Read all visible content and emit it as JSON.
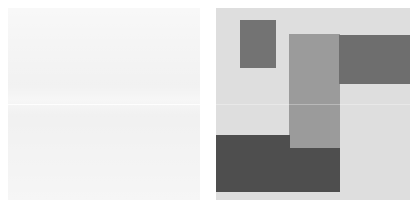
{
  "canvas": {
    "width": 417,
    "height": 216,
    "background": "#ffffff",
    "layout": "two-panel-side-by-side"
  },
  "panels": [
    {
      "id": "left-panel",
      "role": "source-image-panel",
      "label": "",
      "x": 8,
      "y": 8,
      "width": 192,
      "height": 192,
      "background": "#f0f0f0",
      "content_description": "near-blank light surface with faint horizontal banding",
      "seam_y": 96,
      "blocks": []
    },
    {
      "id": "right-panel",
      "role": "segmentation-mask-panel",
      "label": "",
      "x": 216,
      "y": 8,
      "width": 194,
      "height": 192,
      "background": "#dedede",
      "content_description": "abstract arrangement of flat gray rectangles",
      "seam_y": 96,
      "blocks": [
        {
          "id": "block-top-left-small",
          "name": "small-upper-left-rect",
          "x": 24,
          "y": 12,
          "width": 36,
          "height": 48,
          "color": "#737373",
          "tone": "mid-dark"
        },
        {
          "id": "block-center-column",
          "name": "center-vertical-rect",
          "x": 73,
          "y": 26,
          "width": 51,
          "height": 115,
          "color": "#9b9b9b",
          "tone": "medium"
        },
        {
          "id": "block-top-right-band",
          "name": "upper-right-band-rect",
          "x": 123,
          "y": 27,
          "width": 71,
          "height": 49,
          "color": "#6e6e6e",
          "tone": "dark"
        },
        {
          "id": "block-bottom-left",
          "name": "lower-left-large-rect",
          "x": 0,
          "y": 127,
          "width": 74,
          "height": 57,
          "color": "#4e4e4e",
          "tone": "darkest"
        },
        {
          "id": "block-bottom-right",
          "name": "lower-right-rect",
          "x": 74,
          "y": 140,
          "width": 50,
          "height": 44,
          "color": "#4e4e4e",
          "tone": "darkest"
        }
      ]
    }
  ],
  "palette": {
    "page_background": "#ffffff",
    "panel_light": "#f0f0f0",
    "mask_background": "#dedede",
    "tone_medium": "#9b9b9b",
    "tone_mid_dark": "#737373",
    "tone_dark": "#6e6e6e",
    "tone_darkest": "#4e4e4e"
  }
}
